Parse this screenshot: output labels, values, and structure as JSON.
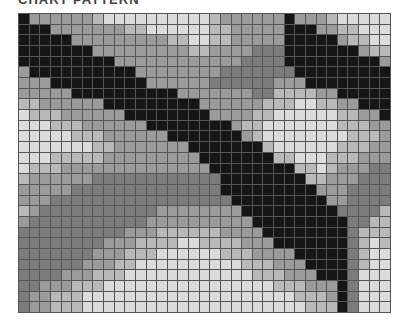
{
  "caption": "CHART PATTERN",
  "grid": {
    "columns": 35,
    "rows": 28,
    "palette": {
      "0": "#151515",
      "1": "#7c7c7c",
      "2": "#9b9b9b",
      "3": "#b9b9b9",
      "4": "#dcdcdc"
    },
    "cells": [
      "02222223444444444432222220222344444",
      "00022222223344444433222220002233444",
      "00000222222222334433222220000023344",
      "00000002222222223322221110000000233",
      "00000000022222222222211110000000002",
      "20000000000222222221111111000000000",
      "22200000000022222211111122200000000",
      "22222000000000022222221133332200000",
      "33222222000000000222222333443322000",
      "43332222220000000022223344444433220",
      "44433322222200000000233444444433322",
      "44444333222222000000023444444443332",
      "44444443322222220000000344444433322",
      "44433333222222222000000033444333222",
      "43332222222222222200000000334322211",
      "32222221111111111110000000033222111",
      "22222111111111111110000000002221111",
      "22211111111111111111000000000221111",
      "32111111111112222222200000000011113",
      "21111111111122222222220000000001133",
      "11111111112223333332222000000001333",
      "11111111222333344333322200000001343",
      "11111112223334444443332222000001344",
      "11111122233444444444433322200001344",
      "11112223334444444444443332220001444",
      "11222333444444444444444433322201444",
      "12233344444444444444444444333201444",
      "12233344444444444444444444433301444"
    ]
  }
}
